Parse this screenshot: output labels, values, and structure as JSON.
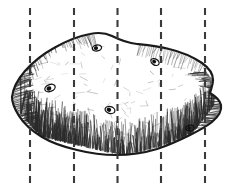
{
  "figure": {
    "caption": "",
    "width": 236,
    "height": 190,
    "background_color": "#ffffff"
  },
  "colors": {
    "outline": "#1a1a1a",
    "hatch": "#2b2b2b",
    "dashed_line": "#3a3a3a",
    "body_fill": "#ffffff",
    "eye_spot": "#111111",
    "background": "#ffffff"
  },
  "section_lines": {
    "name": "vertical-dashed-section-lines",
    "count": 5,
    "orientation": "vertical",
    "style": "dashed",
    "stroke_width": 2.1,
    "dash_pattern": "7 5",
    "y_top": 8,
    "y_bottom": 183,
    "x_positions": [
      30,
      74,
      117.5,
      161,
      205
    ],
    "spacing": 43.75
  },
  "solid": {
    "name": "potato-body",
    "label": "",
    "outline_stroke_width": 2.2,
    "bounds": {
      "left": 12,
      "right": 222,
      "top": 33,
      "bottom": 156
    },
    "outline_path": "M 12 97 C 13 88 18 79 25 71 C 33 62 43 54 54 48 C 66 41 79 36 90 34 C 99 32 106 33 112 36 C 120 40 128 43 137 44 C 147 45 158 46 169 49 C 182 52 193 57 202 63 C 209 68 213 74 213 80 C 213 85 211 89 210 93 C 215 96 220 100 221 105 C 222 111 218 117 212 122 C 206 127 198 131 190 135 C 180 140 169 145 157 149 C 144 153 130 155 116 155 C 102 155 89 153 77 150 C 64 147 52 143 42 137 C 32 131 24 124 19 116 C 14 108 12 102 12 97 Z",
    "eye_spots": [
      {
        "name": "eye-spot-1",
        "cx": 50,
        "cy": 88,
        "rx": 5.4,
        "ry": 3.4,
        "rotation": -22
      },
      {
        "name": "eye-spot-2",
        "cx": 97,
        "cy": 48,
        "rx": 4.6,
        "ry": 3.0,
        "rotation": -10
      },
      {
        "name": "eye-spot-3",
        "cx": 110,
        "cy": 110,
        "rx": 5.0,
        "ry": 3.4,
        "rotation": 15
      },
      {
        "name": "eye-spot-4",
        "cx": 155,
        "cy": 62,
        "rx": 4.4,
        "ry": 3.0,
        "rotation": 30
      },
      {
        "name": "eye-spot-5",
        "cx": 190,
        "cy": 128,
        "rx": 4.2,
        "ry": 2.8,
        "rotation": -5
      }
    ],
    "shading": {
      "type": "pen-and-ink-hatching",
      "regions": [
        "left-edge",
        "bottom-edge",
        "bottom-right",
        "right-tip",
        "interior-stipple"
      ]
    }
  }
}
